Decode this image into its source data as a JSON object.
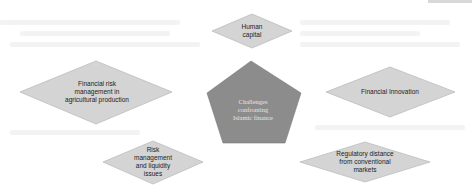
{
  "diagram": {
    "type": "hub-and-spoke",
    "center": {
      "shape": "pentagon",
      "text_lines": [
        "Challenges",
        "confronting",
        "Islamic finance"
      ],
      "fill": "#8c8c8c",
      "text_color": "#e6e6e6"
    },
    "nodes": [
      {
        "id": "human-capital",
        "shape": "diamond",
        "text_lines": [
          "Human",
          "capital"
        ]
      },
      {
        "id": "financial-risk-agri",
        "shape": "diamond",
        "text_lines": [
          "Financial risk",
          "management in",
          "agricultural production"
        ]
      },
      {
        "id": "financial-innovation",
        "shape": "diamond",
        "text_lines": [
          "Financial Innovation"
        ]
      },
      {
        "id": "risk-liquidity",
        "shape": "diamond",
        "text_lines": [
          "Risk",
          "management",
          "and liquidity",
          "issues"
        ]
      },
      {
        "id": "regulatory-distance",
        "shape": "diamond",
        "text_lines": [
          "Regulatory distance",
          "from conventional",
          "markets"
        ]
      }
    ],
    "colors": {
      "diamond_fill": "#d4d4d4",
      "diamond_stroke": "#bdbdbd",
      "pentagon_fill": "#8c8c8c",
      "background": "#ffffff"
    }
  }
}
